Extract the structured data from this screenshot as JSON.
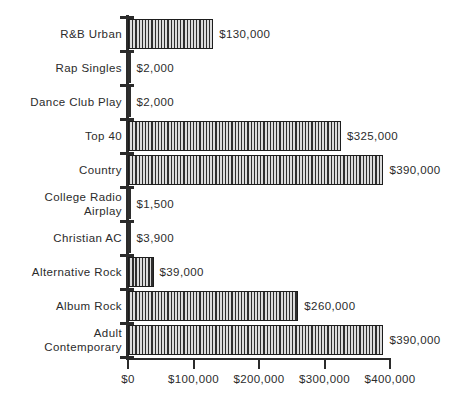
{
  "chart_data": {
    "type": "bar",
    "orientation": "horizontal",
    "title": "",
    "subtitle": "",
    "xlabel": "",
    "ylabel": "",
    "xlim": [
      0,
      400000
    ],
    "grid": false,
    "legend": null,
    "value_label_format": "$#,##0",
    "axis_tick_labels": [
      "$0",
      "$100,000",
      "$200,000",
      "$300,000",
      "$400,000"
    ],
    "axis_tick_values": [
      0,
      100000,
      200000,
      300000,
      400000
    ],
    "categories": [
      "R&B Urban",
      "Rap Singles",
      "Dance Club Play",
      "Top 40",
      "Country",
      "College Radio\nAirplay",
      "Christian AC",
      "Alternative  Rock",
      "Album Rock",
      "Adult\nContemporary"
    ],
    "values": [
      130000,
      2000,
      2000,
      325000,
      390000,
      1500,
      3900,
      39000,
      260000,
      390000
    ],
    "value_labels": [
      "$130,000",
      "$2,000",
      "$2,000",
      "$325,000",
      "$390,000",
      "$1,500",
      "$3,900",
      "$39,000",
      "$260,000",
      "$390,000"
    ],
    "bar_style": {
      "fill": "#d6d6d6",
      "hatch": "vertical-lines",
      "hatch_color": "#2e2e2e",
      "edge_color": "#1d1d1d"
    },
    "text_color": "#2b2b2b",
    "background": "#ffffff"
  }
}
